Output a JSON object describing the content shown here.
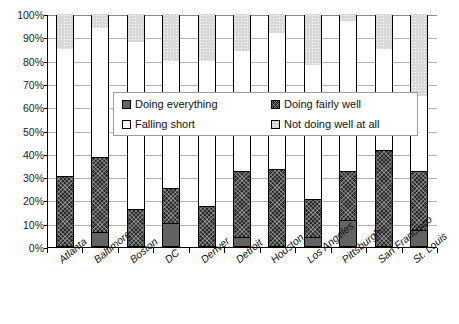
{
  "chart_data": {
    "type": "bar",
    "subtype": "stacked-100-percent",
    "title": "",
    "xlabel": "",
    "ylabel": "",
    "ylim": [
      0,
      100
    ],
    "ytick_labels": [
      "100%",
      "90%",
      "80%",
      "70%",
      "60%",
      "50%",
      "40%",
      "30%",
      "20%",
      "10%",
      "0%"
    ],
    "ytick_values": [
      100,
      90,
      80,
      70,
      60,
      50,
      40,
      30,
      20,
      10,
      0
    ],
    "grid": true,
    "legend_position": "center",
    "categories": [
      "Atlanta",
      "Baltimore",
      "Boston",
      "DC",
      "Denver",
      "Detroit",
      "Houston",
      "Los Angeles",
      "Pittsburgh",
      "San Francisco",
      "St. Louis"
    ],
    "series": [
      {
        "name": "Doing everything",
        "color": "#636363",
        "values": [
          0,
          6,
          0,
          10,
          0,
          4,
          0,
          4,
          11,
          0,
          7
        ]
      },
      {
        "name": "Doing fairly well",
        "color": "#2b2b2b",
        "values": [
          30,
          32,
          16,
          15,
          17,
          28,
          33,
          16,
          21,
          41,
          25
        ]
      },
      {
        "name": "Falling short",
        "color": "#ffffff",
        "values": [
          55,
          56,
          72,
          55,
          63,
          52,
          59,
          58,
          65,
          44,
          33
        ]
      },
      {
        "name": "Not doing well at all",
        "color": "#d8d8d8",
        "values": [
          15,
          6,
          12,
          20,
          20,
          16,
          8,
          22,
          3,
          15,
          35
        ]
      }
    ],
    "cumulative_tops": [
      [
        30,
        85,
        100
      ],
      [
        6,
        38,
        94,
        100
      ],
      [
        16,
        88,
        100
      ],
      [
        10,
        25,
        80,
        100
      ],
      [
        17,
        80,
        100
      ],
      [
        4,
        32,
        84,
        100
      ],
      [
        33,
        92,
        100
      ],
      [
        4,
        20,
        78,
        100
      ],
      [
        11,
        32,
        97,
        100
      ],
      [
        41,
        85,
        100
      ],
      [
        7,
        32,
        65,
        100
      ]
    ]
  },
  "legend": {
    "items": [
      {
        "label": "Doing everything",
        "swatch": "doing-everything"
      },
      {
        "label": "Doing fairly well",
        "swatch": "doing-fairly-well"
      },
      {
        "label": "Falling short",
        "swatch": "falling-short"
      },
      {
        "label": "Not doing well at all",
        "swatch": "not-doing-well"
      }
    ]
  }
}
